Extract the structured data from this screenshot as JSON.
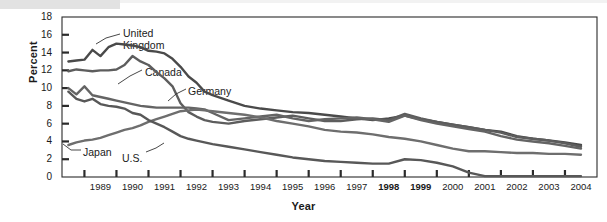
{
  "chart_data": {
    "type": "line",
    "title": "",
    "xlabel": "Year",
    "ylabel": "Percent",
    "grid": false,
    "legend_position": "inline-annotations",
    "xlim": [
      1988.3,
      2005.0
    ],
    "ylim": [
      0,
      18
    ],
    "ytick_labels": [
      "18",
      "16",
      "14",
      "12",
      "10",
      "8",
      "6",
      "4",
      "2",
      "0"
    ],
    "ytick_values": [
      18,
      16,
      14,
      12,
      10,
      8,
      6,
      4,
      2,
      0
    ],
    "xtick_labels": [
      "1989",
      "1990",
      "1991",
      "1992",
      "1993",
      "1994",
      "1995",
      "1996",
      "1997",
      "1998",
      "1999",
      "2000",
      "2001",
      "2002",
      "2003",
      "2004"
    ],
    "xtick_values": [
      1989,
      1990,
      1991,
      1992,
      1993,
      1994,
      1995,
      1996,
      1997,
      1998,
      1999,
      2000,
      2001,
      2002,
      2003,
      2004
    ],
    "xtick_bold": [
      "1998",
      "1999"
    ],
    "x": [
      1988.5,
      1988.75,
      1989,
      1989.25,
      1989.5,
      1989.75,
      1990,
      1990.25,
      1990.5,
      1990.75,
      1991,
      1991.25,
      1991.5,
      1991.75,
      1992,
      1992.25,
      1992.5,
      1992.75,
      1993,
      1993.5,
      1994,
      1994.5,
      1995,
      1995.5,
      1996,
      1996.5,
      1997,
      1997.5,
      1998,
      1998.5,
      1999,
      1999.5,
      2000,
      2000.5,
      2001,
      2001.5,
      2002,
      2002.5,
      2003,
      2003.5,
      2004,
      2004.5
    ],
    "series": [
      {
        "name": "United Kingdom",
        "color": "#4a4a4a",
        "values": [
          13.0,
          13.1,
          13.2,
          14.3,
          13.6,
          14.6,
          15.0,
          14.9,
          14.8,
          14.6,
          14.2,
          14.1,
          13.9,
          13.3,
          12.4,
          11.3,
          10.6,
          9.6,
          9.2,
          8.6,
          8.0,
          7.7,
          7.5,
          7.3,
          7.2,
          7.0,
          6.8,
          6.6,
          6.4,
          6.6,
          6.9,
          6.5,
          6.2,
          5.9,
          5.6,
          5.3,
          5.1,
          4.6,
          4.3,
          4.1,
          3.9,
          3.6
        ]
      },
      {
        "name": "Canada",
        "color": "#5d5d5d",
        "values": [
          11.9,
          12.1,
          12.0,
          11.9,
          12.0,
          12.0,
          12.1,
          12.6,
          13.6,
          13.0,
          12.6,
          11.8,
          11.1,
          10.2,
          8.3,
          7.3,
          6.8,
          6.4,
          6.2,
          6.0,
          6.3,
          6.5,
          6.7,
          6.9,
          6.6,
          6.3,
          6.3,
          6.5,
          6.6,
          6.4,
          7.1,
          6.6,
          6.2,
          5.9,
          5.6,
          5.3,
          5.0,
          4.5,
          4.3,
          4.1,
          3.8,
          3.4
        ]
      },
      {
        "name": "Germany",
        "color": "#646464",
        "values": [
          10.0,
          9.3,
          10.2,
          9.2,
          9.0,
          8.8,
          8.6,
          8.4,
          8.2,
          8.0,
          7.9,
          7.8,
          7.8,
          7.8,
          7.8,
          7.8,
          7.7,
          7.6,
          7.2,
          6.4,
          6.6,
          6.8,
          7.0,
          6.6,
          6.3,
          6.5,
          6.6,
          6.7,
          6.5,
          6.2,
          6.9,
          6.4,
          6.0,
          5.7,
          5.4,
          5.1,
          4.6,
          4.2,
          4.0,
          3.8,
          3.5,
          3.2
        ]
      },
      {
        "name": "Japan",
        "color": "#6e6e6e",
        "values": [
          3.6,
          3.9,
          4.1,
          4.2,
          4.4,
          4.7,
          5.0,
          5.3,
          5.5,
          5.8,
          6.2,
          6.5,
          6.8,
          7.1,
          7.4,
          7.5,
          7.6,
          7.5,
          7.4,
          7.2,
          7.0,
          6.7,
          6.3,
          6.0,
          5.7,
          5.3,
          5.1,
          5.0,
          4.8,
          4.5,
          4.3,
          4.0,
          3.6,
          3.2,
          2.9,
          2.9,
          2.8,
          2.7,
          2.7,
          2.6,
          2.6,
          2.5
        ]
      },
      {
        "name": "U.S.",
        "color": "#585858",
        "values": [
          9.6,
          8.8,
          8.5,
          8.8,
          8.2,
          8.0,
          7.9,
          7.7,
          7.2,
          7.0,
          6.4,
          6.0,
          5.6,
          5.1,
          4.6,
          4.3,
          4.1,
          3.9,
          3.7,
          3.4,
          3.1,
          2.8,
          2.5,
          2.2,
          2.0,
          1.8,
          1.7,
          1.6,
          1.5,
          1.5,
          2.0,
          1.9,
          1.6,
          1.2,
          0.5,
          0.1,
          0.1,
          0.1,
          0.1,
          0.1,
          0.1,
          0.1
        ]
      }
    ],
    "annotations": [
      {
        "name": "United Kingdom",
        "text_lines": [
          "United",
          "Kingdom"
        ],
        "x": 123,
        "y": 27
      },
      {
        "name": "Canada",
        "text_lines": [
          "Canada"
        ],
        "x": 145,
        "y": 66
      },
      {
        "name": "Germany",
        "text_lines": [
          "Germany"
        ],
        "x": 188,
        "y": 85
      },
      {
        "name": "Japan",
        "text_lines": [
          "Japan"
        ],
        "x": 83,
        "y": 146
      },
      {
        "name": "U.S.",
        "text_lines": [
          "U.S."
        ],
        "x": 122,
        "y": 152
      }
    ]
  }
}
